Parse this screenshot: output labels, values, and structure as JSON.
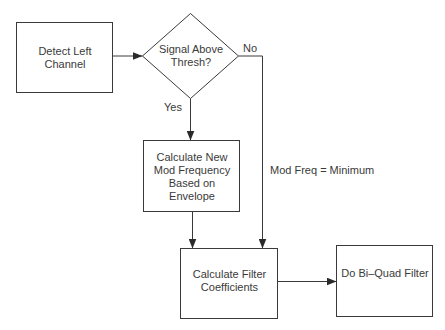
{
  "diagram": {
    "nodes": {
      "detect": {
        "label": "Detect Left\nChannel",
        "shape": "rect"
      },
      "decision": {
        "label": "Signal Above\nThresh?",
        "shape": "diamond"
      },
      "calc_mod": {
        "label": "Calculate New\nMod Frequency\nBased on\nEnvelope",
        "shape": "rect"
      },
      "calc_coef": {
        "label": "Calculate Filter\nCoefficients",
        "shape": "rect"
      },
      "biquad": {
        "label": "Do Bi–Quad Filter",
        "shape": "rect"
      }
    },
    "edge_labels": {
      "no": "No",
      "yes": "Yes",
      "mod_min": "Mod Freq = Minimum"
    },
    "edges": [
      {
        "from": "detect",
        "to": "decision"
      },
      {
        "from": "decision",
        "to": "calc_mod",
        "label": "Yes"
      },
      {
        "from": "decision",
        "to": "calc_coef",
        "label": "No"
      },
      {
        "from": "calc_mod",
        "to": "calc_coef"
      },
      {
        "from": "calc_coef",
        "to": "biquad"
      }
    ],
    "colors": {
      "stroke": "#3a3a3a",
      "text": "#3a3a3a",
      "background": "#ffffff"
    }
  }
}
